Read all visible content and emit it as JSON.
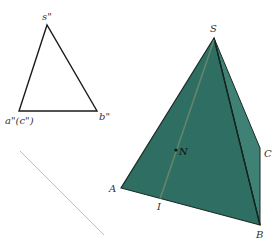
{
  "diagram": {
    "projection_view": {
      "labels": {
        "s": "s\"",
        "a_c": "a\"(c\")",
        "b": "b\""
      },
      "stroke_color": "#1a1a1a"
    },
    "axis_line": {
      "color": "#bdbdbd"
    },
    "pyramid": {
      "labels": {
        "S": "S",
        "A": "A",
        "B": "B",
        "C": "C",
        "N": "N",
        "I": "I"
      },
      "front_face_color": "#2f6f63",
      "side_face_color": "#3f8275",
      "edge_color": "#1a2a26",
      "auxiliary_line_color": "#7a8f6e"
    }
  }
}
